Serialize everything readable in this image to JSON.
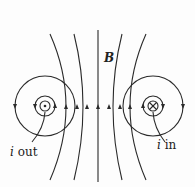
{
  "diagram": {
    "field_label": "B",
    "wire_left": {
      "label_var": "i",
      "label_dir": "out",
      "symbol": "dot"
    },
    "wire_right": {
      "label_var": "i",
      "label_dir": "in",
      "symbol": "cross"
    },
    "line_color": "#2a2a2a",
    "center_arrow_direction": "up",
    "left_loop_direction": "counterclockwise",
    "right_loop_direction": "clockwise"
  }
}
